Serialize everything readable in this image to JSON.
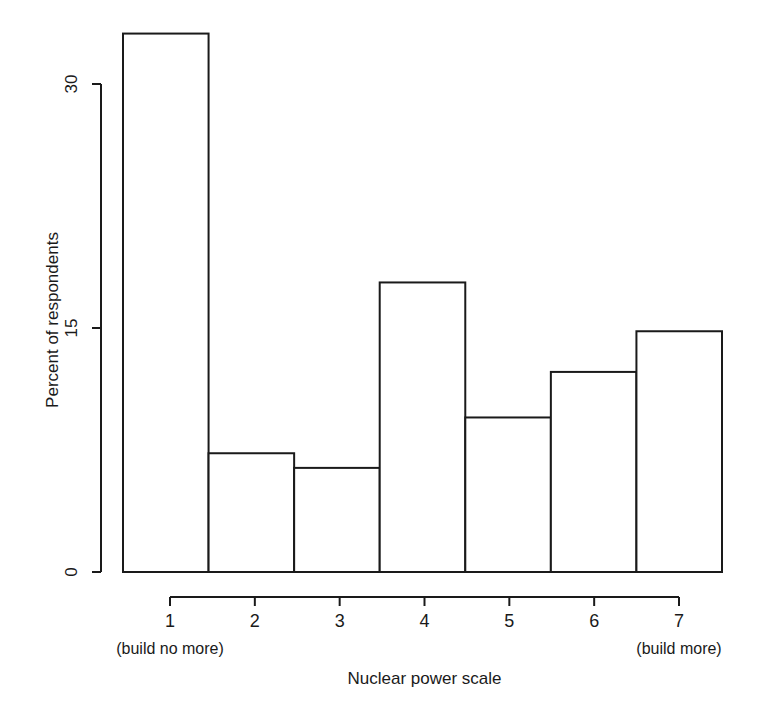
{
  "chart_data": {
    "type": "bar",
    "title": "",
    "xlabel": "Nuclear power scale",
    "ylabel": "Percent of respondents",
    "categories": [
      "1",
      "2",
      "3",
      "4",
      "5",
      "6",
      "7"
    ],
    "values": [
      33.1,
      7.3,
      6.4,
      17.8,
      9.5,
      12.3,
      14.8
    ],
    "ylim": [
      0,
      33.1
    ],
    "yticks": [
      0,
      15,
      30
    ],
    "ytick_labels": [
      "0",
      "15",
      "30"
    ],
    "xtick_labels": [
      "1",
      "2",
      "3",
      "4",
      "5",
      "6",
      "7"
    ],
    "x_endcap_left": "(build no more)",
    "x_endcap_right": "(build more)",
    "grid": false,
    "legend": false,
    "bar_fill": "#ffffff",
    "bar_stroke": "#1a1a1a",
    "axis_color": "#1a1a1a",
    "background": "#ffffff"
  },
  "axes": {
    "y_title": "Percent of respondents",
    "x_title": "Nuclear power scale"
  }
}
